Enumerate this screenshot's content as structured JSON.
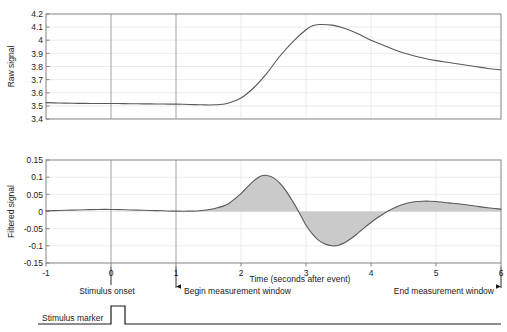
{
  "figure": {
    "background": "#ffffff",
    "line_color": "#595959",
    "fill_color": "#c8c8c8",
    "grid_color": "#d9d9d9",
    "axis_color": "#6e6e6e",
    "marker_color": "#1a1a1a"
  },
  "chart_data": [
    {
      "type": "line",
      "name": "raw-signal-panel",
      "title": "",
      "xlabel": "",
      "ylabel": "Raw signal",
      "xlim": [
        -1,
        6
      ],
      "ylim": [
        3.4,
        4.2
      ],
      "xticks": [
        -1,
        0,
        1,
        2,
        3,
        4,
        5,
        6
      ],
      "xticklabels": [
        "-1",
        "0",
        "1",
        "2",
        "3",
        "4",
        "5",
        "6"
      ],
      "yticks": [
        3.4,
        3.5,
        3.6,
        3.7,
        3.8,
        3.9,
        4.0,
        4.1,
        4.2
      ],
      "yticklabels": [
        "3.4",
        "3.5",
        "3.6",
        "3.7",
        "3.8",
        "3.9",
        "4",
        "4.1",
        "4.2"
      ],
      "grid": true,
      "legend": "none",
      "series": [
        {
          "name": "Raw signal",
          "x": [
            -1,
            -0.8,
            -0.6,
            -0.4,
            -0.2,
            0,
            0.2,
            0.4,
            0.6,
            0.8,
            1,
            1.2,
            1.4,
            1.6,
            1.8,
            2,
            2.2,
            2.4,
            2.6,
            2.8,
            3,
            3.1,
            3.2,
            3.4,
            3.6,
            3.8,
            4,
            4.2,
            4.4,
            4.6,
            4.8,
            5,
            5.2,
            5.4,
            5.6,
            5.8,
            6
          ],
          "y": [
            3.525,
            3.522,
            3.52,
            3.519,
            3.518,
            3.518,
            3.517,
            3.516,
            3.515,
            3.514,
            3.513,
            3.511,
            3.508,
            3.508,
            3.52,
            3.56,
            3.64,
            3.75,
            3.88,
            3.99,
            4.08,
            4.11,
            4.12,
            4.115,
            4.09,
            4.05,
            4.0,
            3.96,
            3.92,
            3.89,
            3.865,
            3.845,
            3.83,
            3.815,
            3.8,
            3.785,
            3.775
          ]
        }
      ]
    },
    {
      "type": "area",
      "name": "filtered-signal-panel",
      "title": "",
      "xlabel": "Time (seconds after event)",
      "ylabel": "Filtered signal",
      "xlim": [
        -1,
        6
      ],
      "ylim": [
        -0.15,
        0.15
      ],
      "xticks": [
        -1,
        0,
        1,
        2,
        3,
        4,
        5,
        6
      ],
      "xticklabels": [
        "-1",
        "0",
        "1",
        "2",
        "3",
        "4",
        "5",
        "6"
      ],
      "yticks": [
        -0.15,
        -0.1,
        -0.05,
        0,
        0.05,
        0.1,
        0.15
      ],
      "yticklabels": [
        "-0.15",
        "-0.1",
        "-0.05",
        "0",
        "0.05",
        "0.1",
        "0.15"
      ],
      "grid": true,
      "legend": "none",
      "fill_from": 0,
      "fill_range": [
        1,
        6
      ],
      "series": [
        {
          "name": "Filtered signal",
          "x": [
            -1,
            -0.8,
            -0.6,
            -0.4,
            -0.2,
            0,
            0.2,
            0.4,
            0.6,
            0.8,
            1,
            1.2,
            1.4,
            1.6,
            1.8,
            2,
            2.1,
            2.2,
            2.3,
            2.4,
            2.5,
            2.6,
            2.7,
            2.8,
            2.85,
            2.9,
            3,
            3.1,
            3.2,
            3.3,
            3.4,
            3.45,
            3.5,
            3.6,
            3.7,
            3.8,
            3.9,
            4,
            4.1,
            4.2,
            4.25,
            4.3,
            4.4,
            4.5,
            4.6,
            4.7,
            4.8,
            4.9,
            5,
            5.2,
            5.4,
            5.6,
            5.8,
            6
          ],
          "y": [
            0.002,
            0.003,
            0.004,
            0.005,
            0.006,
            0.006,
            0.005,
            0.004,
            0.003,
            0.002,
            0.001,
            0.001,
            0.003,
            0.009,
            0.022,
            0.052,
            0.072,
            0.09,
            0.103,
            0.105,
            0.098,
            0.082,
            0.058,
            0.028,
            0.012,
            -0.005,
            -0.04,
            -0.066,
            -0.085,
            -0.095,
            -0.1,
            -0.1,
            -0.098,
            -0.09,
            -0.078,
            -0.063,
            -0.047,
            -0.032,
            -0.018,
            -0.006,
            0.0,
            0.005,
            0.014,
            0.021,
            0.026,
            0.029,
            0.03,
            0.03,
            0.029,
            0.025,
            0.021,
            0.016,
            0.011,
            0.007
          ]
        }
      ]
    }
  ],
  "annotations": {
    "stimulus_onset": {
      "label": "Stimulus onset",
      "time": 0
    },
    "begin_window": {
      "label": "Begin measurement window",
      "time": 1
    },
    "end_window": {
      "label": "End measurement window",
      "time": 6
    },
    "stimulus_marker": {
      "label": "Stimulus marker",
      "pulse_start": 0,
      "pulse_end": 0.22,
      "baseline": 0,
      "high": 1
    }
  }
}
